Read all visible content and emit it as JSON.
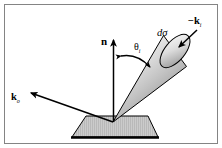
{
  "figure": {
    "kind": "scattering-geometry-diagram",
    "width": 222,
    "height": 148,
    "background_color": "#ffffff",
    "border": {
      "color": "#808080",
      "width_px": 1,
      "inset_px": 4
    },
    "labels": {
      "normal": {
        "text": "n",
        "style": "bold-upright",
        "x": 106,
        "y": 42
      },
      "incident_angle": {
        "base": "θ",
        "subscript": "i",
        "x": 139,
        "y": 48
      },
      "differential_cross_section": {
        "text": "dσ",
        "style": "italic",
        "x": 161,
        "y": 34
      },
      "incident_direction": {
        "base": "−k",
        "subscript": "i",
        "style": "bold",
        "x": 196,
        "y": 21
      },
      "outgoing_direction": {
        "base": "k",
        "subscript": "o",
        "style": "bold",
        "x": 14,
        "y": 97
      }
    },
    "geometry": {
      "origin": {
        "x": 113,
        "y": 122
      },
      "normal_arrow": {
        "from": {
          "x": 113.5,
          "y": 122
        },
        "to": {
          "x": 113.5,
          "y": 39
        },
        "arrowhead": "up",
        "color": "#000000"
      },
      "outgoing_arrow": {
        "from": {
          "x": 113,
          "y": 122
        },
        "to": {
          "x": 29,
          "y": 92
        },
        "arrowhead": "up-left",
        "color": "#000000"
      },
      "incident_arrow": {
        "from": {
          "x": 196,
          "y": 30
        },
        "to": {
          "x": 178,
          "y": 48
        },
        "arrowhead": "down-left",
        "color": "#000000"
      },
      "angle_arc": {
        "from": {
          "x": 120,
          "y": 56
        },
        "to": {
          "x": 152,
          "y": 68
        },
        "double_headed": true,
        "color": "#000000"
      },
      "cone": {
        "apex": {
          "x": 113,
          "y": 122
        },
        "cap_center": {
          "x": 172,
          "y": 52
        },
        "cap_rx": 10,
        "cap_ry": 20,
        "cap_rotation_deg": 40,
        "fill_light": "#f2f2f2",
        "fill_dark": "#8c8c8c",
        "outline": "#000000"
      },
      "surface_plane": {
        "shape": "trapezoid",
        "points": "86,116 148,116 158,137 72,137",
        "fill": "#c9c9c9",
        "hatch_color": "#a8a8a8",
        "outline": "#000000",
        "base_edge_thickness": 3
      }
    }
  }
}
